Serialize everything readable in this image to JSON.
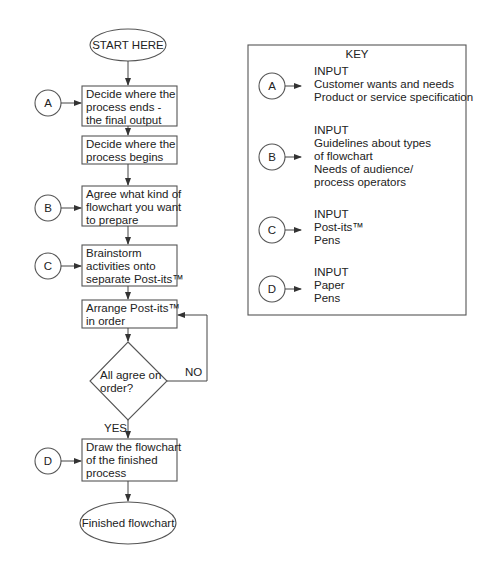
{
  "flowchart": {
    "start": {
      "label": "START HERE"
    },
    "steps": [
      {
        "id": "step-1",
        "lines": [
          "Decide where the",
          "process ends -",
          "the final output"
        ],
        "input": "A"
      },
      {
        "id": "step-2",
        "lines": [
          "Decide where the",
          "process begins"
        ],
        "input": null
      },
      {
        "id": "step-3",
        "lines": [
          "Agree what kind of",
          "flowchart you want",
          "to prepare"
        ],
        "input": "B"
      },
      {
        "id": "step-4",
        "lines": [
          "Brainstorm",
          "activities onto",
          "separate Post-its™"
        ],
        "input": "C"
      },
      {
        "id": "step-5",
        "lines": [
          "Arrange Post-its™",
          "in order"
        ],
        "input": null
      }
    ],
    "decision": {
      "lines": [
        "All agree on",
        "order?"
      ],
      "yes_label": "YES",
      "no_label": "NO"
    },
    "final_step": {
      "lines": [
        "Draw the flowchart",
        "of the finished",
        "process"
      ],
      "input": "D"
    },
    "end": {
      "label": "Finished flowchart"
    }
  },
  "key": {
    "title": "KEY",
    "entries": [
      {
        "marker": "A",
        "lines": [
          "INPUT",
          "Customer wants and needs",
          "Product or service specification"
        ]
      },
      {
        "marker": "B",
        "lines": [
          "INPUT",
          "Guidelines about types",
          "of flowchart",
          "Needs of audience/",
          "process operators"
        ]
      },
      {
        "marker": "C",
        "lines": [
          "INPUT",
          "Post-its™",
          "Pens"
        ]
      },
      {
        "marker": "D",
        "lines": [
          "INPUT",
          "Paper",
          "Pens"
        ]
      }
    ]
  }
}
